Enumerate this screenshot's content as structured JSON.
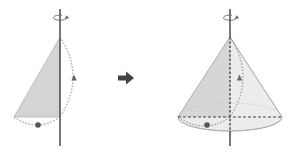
{
  "diagram": {
    "left_figure": {
      "label": "right-triangle-on-axis",
      "fill_color": "#d4d4d4",
      "axis_color": "#555555"
    },
    "transition_arrow": {
      "label": "transforms-into",
      "color": "#444444"
    },
    "right_figure": {
      "label": "cone-of-revolution",
      "fill_color": "#d9d9d9",
      "axis_color": "#555555"
    },
    "colors": {
      "outline": "#aaaaaa",
      "dotted": "#777777",
      "marker": "#555555"
    }
  }
}
